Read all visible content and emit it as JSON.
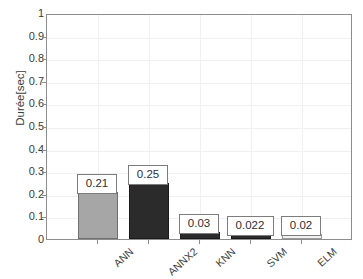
{
  "chart_data": {
    "type": "bar",
    "title": "",
    "xlabel": "",
    "ylabel": "Durée[sec]",
    "categories": [
      "ANN",
      "ANNX2",
      "KNN",
      "SVM",
      "ELM"
    ],
    "values": [
      0.21,
      0.25,
      0.03,
      0.022,
      0.02
    ],
    "value_labels": [
      "0.21",
      "0.25",
      "0.03",
      "0.022",
      "0.02"
    ],
    "bar_colors": [
      "#a6a6a6",
      "#2b2b2b",
      "#2b2b2b",
      "#2b2b2b",
      "#f2f2f2"
    ],
    "bar_edge_colors": [
      "#6f6f6f",
      "#1a1a1a",
      "#1a1a1a",
      "#1a1a1a",
      "#9a9a9a"
    ],
    "ylim": [
      0,
      1
    ],
    "xlim": [
      0,
      6
    ],
    "ytick_labels": [
      "0",
      "0.1",
      "0.2",
      "0.3",
      "0.4",
      "0.5",
      "0.6",
      "0.7",
      "0.8",
      "0.9",
      "1"
    ],
    "ytick_values": [
      0,
      0.1,
      0.2,
      0.3,
      0.4,
      0.5,
      0.6,
      0.7,
      0.8,
      0.9,
      1
    ],
    "grid": true,
    "legend": null,
    "axis_color": "#8d8d8d",
    "grid_color": "#f0f0f0",
    "background": "#ffffff"
  },
  "caption_strip": ". .  .. .  . ... .  ... .  .. .  . .  .. .  . ..  . .  ... ."
}
